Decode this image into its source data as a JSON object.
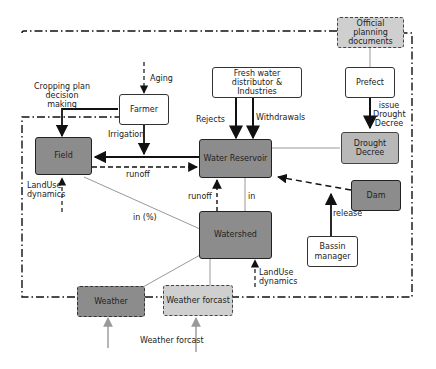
{
  "nodes": {
    "official_planning": "Official planning documents",
    "prefect": "Prefect",
    "drought_decree": "Drought Decree",
    "fresh_water": "Fresh water distributor & Industries",
    "farmer": "Farmer",
    "field": "Field",
    "water_reservoir": "Water Reservoir",
    "dam": "Dam",
    "watershed": "Watershed",
    "bassin_manager": "Bassin manager",
    "weather": "Weather",
    "weather_forcast": "Weather forcast"
  },
  "edge_labels": {
    "aging": "Aging",
    "cropping_plan": "Cropping plan decision making",
    "irrigation": "Irrigation",
    "rejects": "Rejects",
    "withdrawals": "Withdrawals",
    "issue_drought": "issue Drought Decree",
    "runoff_field": "runoff",
    "runoff_watershed": "runoff",
    "in_reservoir": "in",
    "in_percent": "in (%)",
    "landuse_field": "LandUse dynamics",
    "landuse_watershed": "LandUse dynamics",
    "release": "release",
    "weather_forcast_input": "Weather forcast"
  },
  "colors": {
    "dark_fill": "#8c8c8c",
    "medium_fill": "#b8b8b8",
    "light_fill": "#cfcfcf",
    "line": "#111111",
    "thin_line": "#999999"
  }
}
